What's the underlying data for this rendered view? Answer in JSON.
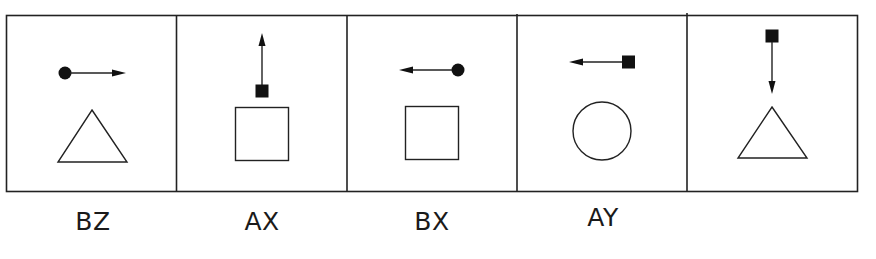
{
  "puzzle": {
    "panels": [
      {
        "index": 1,
        "symbol": {
          "type": "circle",
          "filled": true
        },
        "arrow": "right",
        "shape": "triangle",
        "label": "BZ"
      },
      {
        "index": 2,
        "symbol": {
          "type": "square",
          "filled": true
        },
        "arrow": "up",
        "shape": "square",
        "label": "AX"
      },
      {
        "index": 3,
        "symbol": {
          "type": "circle",
          "filled": true
        },
        "arrow": "left",
        "shape": "square",
        "label": "BX"
      },
      {
        "index": 4,
        "symbol": {
          "type": "square",
          "filled": true
        },
        "arrow": "left",
        "shape": "circle",
        "label": "AY"
      },
      {
        "index": 5,
        "symbol": {
          "type": "square",
          "filled": true
        },
        "arrow": "down",
        "shape": "triangle",
        "label": ""
      }
    ],
    "colors": {
      "stroke": "#222222",
      "fill": "#111111",
      "background": "#ffffff"
    }
  }
}
